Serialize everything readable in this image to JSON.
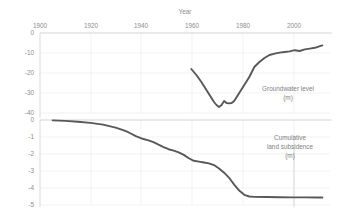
{
  "chart_data": [
    {
      "type": "line",
      "title": "Year",
      "xlabel": "Year",
      "ylabel": "Groundwater level (m)",
      "series_label": "Groundwater level",
      "series_units": "(m)",
      "xlim": [
        1895,
        2010
      ],
      "ylim": [
        -40,
        0
      ],
      "xticks": [
        1900,
        1920,
        1940,
        1960,
        1980,
        2000
      ],
      "xticklabels": [
        "1900",
        "1920",
        "1940",
        "1960",
        "1980",
        "2000"
      ],
      "yticks": [
        0,
        -10,
        -20,
        -30,
        -40
      ],
      "yticklabels": [
        "0",
        "-10",
        "-20",
        "-30",
        "-40"
      ],
      "grid": true,
      "legend": "in-plot",
      "series": [
        {
          "name": "Groundwater level",
          "x": [
            1955,
            1957,
            1959,
            1961,
            1963,
            1964,
            1965,
            1966,
            1967,
            1968,
            1969,
            1970,
            1971,
            1972,
            1973,
            1974,
            1975,
            1976,
            1977,
            1978,
            1979,
            1980,
            1982,
            1984,
            1986,
            1988,
            1990,
            1992,
            1994,
            1996,
            1998,
            2000,
            2002,
            2004,
            2006,
            2007
          ],
          "values": [
            -18.0,
            -21.0,
            -24.5,
            -28.5,
            -32.5,
            -34.5,
            -36.0,
            -37.0,
            -36.0,
            -34.0,
            -35.0,
            -35.2,
            -35.0,
            -34.0,
            -32.0,
            -30.0,
            -28.0,
            -26.0,
            -24.0,
            -22.0,
            -19.5,
            -17.0,
            -14.5,
            -12.5,
            -11.0,
            -10.3,
            -9.8,
            -9.5,
            -9.2,
            -8.6,
            -9.0,
            -8.2,
            -7.8,
            -7.4,
            -6.6,
            -6.2
          ]
        }
      ]
    },
    {
      "type": "line",
      "xlabel": "Year",
      "ylabel": "Cumulative land subsidence (m)",
      "series_label": "Cumulative land subsidence",
      "series_units": "(m)",
      "xlim": [
        1895,
        2010
      ],
      "ylim": [
        -5,
        0
      ],
      "xticks": [
        1900,
        1920,
        1940,
        1960,
        1980,
        2000
      ],
      "xticklabels": [
        "1900",
        "1920",
        "1940",
        "1960",
        "1980",
        "2000"
      ],
      "yticks": [
        0,
        -1,
        -2,
        -3,
        -4,
        -5
      ],
      "yticklabels": [
        "0",
        "-1",
        "-2",
        "-3",
        "-4",
        "-5"
      ],
      "grid": true,
      "legend": "in-plot",
      "series": [
        {
          "name": "Cumulative land subsidence",
          "x": [
            1900,
            1905,
            1910,
            1915,
            1920,
            1925,
            1928,
            1930,
            1933,
            1936,
            1938,
            1940,
            1942,
            1944,
            1946,
            1948,
            1950,
            1952,
            1954,
            1956,
            1958,
            1960,
            1962,
            1964,
            1966,
            1968,
            1970,
            1972,
            1974,
            1976,
            1978,
            1980,
            1985,
            1990,
            1995,
            2000,
            2005,
            2007
          ],
          "values": [
            -0.02,
            -0.05,
            -0.1,
            -0.17,
            -0.27,
            -0.45,
            -0.6,
            -0.72,
            -0.95,
            -1.12,
            -1.2,
            -1.3,
            -1.45,
            -1.6,
            -1.72,
            -1.8,
            -1.9,
            -2.05,
            -2.25,
            -2.4,
            -2.45,
            -2.5,
            -2.55,
            -2.65,
            -2.85,
            -3.1,
            -3.4,
            -3.8,
            -4.15,
            -4.4,
            -4.5,
            -4.52,
            -4.53,
            -4.54,
            -4.55,
            -4.55,
            -4.56,
            -4.56
          ]
        }
      ]
    }
  ],
  "labels": {
    "top_tick_1900": "1900",
    "top_tick_1920": "1920",
    "top_tick_1940": "1940",
    "top_tick_1960": "1960",
    "top_tick_1980": "1980",
    "top_tick_2000": "2000",
    "axis_title_year": "Year",
    "top_y_0": "0",
    "top_y_10": "-10",
    "top_y_20": "-20",
    "top_y_30": "-30",
    "top_y_40": "-40",
    "bottom_y_0": "0",
    "bottom_y_1": "-1",
    "bottom_y_2": "-2",
    "bottom_y_3": "-3",
    "bottom_y_4": "-4",
    "bottom_y_5": "-5",
    "groundwater_label_line1": "Groundwater level",
    "groundwater_label_line2": "(m)",
    "subsidence_label_line1": "Cumulative",
    "subsidence_label_line2": "land subsidence",
    "subsidence_label_line3": "(m)"
  }
}
